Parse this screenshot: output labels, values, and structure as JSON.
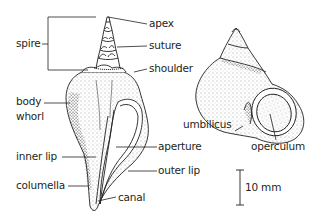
{
  "diagram": {
    "type": "labeled-illustration",
    "figures": [
      {
        "name": "whelk-shell",
        "labels": [
          "spire",
          "apex",
          "suture",
          "shoulder",
          "body whorl",
          "inner lip",
          "aperture",
          "outer lip",
          "columella",
          "canal"
        ]
      },
      {
        "name": "periwinkle-shell",
        "labels": [
          "umbilicus",
          "operculum"
        ]
      }
    ],
    "labels": {
      "spire": "spire",
      "apex": "apex",
      "suture": "suture",
      "shoulder": "shoulder",
      "body_line1": "body",
      "body_line2": "whorl",
      "inner_lip": "inner lip",
      "aperture": "aperture",
      "outer_lip": "outer lip",
      "columella": "columella",
      "canal": "canal",
      "umbilicus": "umbilicus",
      "operculum": "operculum"
    },
    "scale_bar": {
      "label": "10 mm"
    },
    "colors": {
      "ink": "#231f20",
      "background": "#ffffff"
    }
  }
}
